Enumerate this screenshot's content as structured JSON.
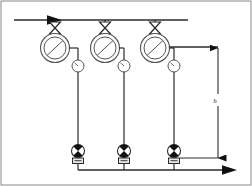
{
  "diagram": {
    "type": "piping-schematic",
    "canvas": {
      "width": 252,
      "height": 186
    },
    "colors": {
      "line": "#2b2b2b",
      "thin_line": "#555555",
      "fill_white": "#ffffff",
      "fill_black": "#111111",
      "background": "#ffffff"
    },
    "frame": {
      "stroke": "#8a8a8a",
      "x": 1,
      "y": 1,
      "width": 250,
      "height": 184
    },
    "supply_header": {
      "name": "supply-header-pipe",
      "y": 20,
      "x_start": 14,
      "x_end": 188,
      "inlet_arrow_x": 62,
      "inlet_arrow_label": "flow-in"
    },
    "return_header": {
      "name": "return-header-pipe",
      "y": 170,
      "x_start": 55,
      "x_end": 232,
      "outlet_arrow_x": 232,
      "outlet_arrow_label": "flow-out"
    },
    "branches": [
      {
        "id": "branch-1",
        "x": 55,
        "valve_y": 26,
        "filter_cy": 48,
        "filter_r_outer": 17,
        "filter_r_inner": 13,
        "gauge_cx": 78,
        "gauge_cy": 66,
        "gauge_r": 6,
        "pump_cy": 152,
        "pump_r": 7,
        "base_y": 162
      },
      {
        "id": "branch-2",
        "x": 105,
        "valve_y": 26,
        "filter_cy": 48,
        "filter_r_outer": 17,
        "filter_r_inner": 13,
        "gauge_cx": 124,
        "gauge_cy": 66,
        "gauge_r": 6,
        "pump_cy": 152,
        "pump_r": 7,
        "base_y": 162
      },
      {
        "id": "branch-3",
        "x": 155,
        "valve_y": 26,
        "filter_cy": 48,
        "filter_r_outer": 17,
        "filter_r_inner": 13,
        "gauge_cx": 174,
        "gauge_cy": 66,
        "gauge_r": 6,
        "pump_cy": 152,
        "pump_r": 7,
        "base_y": 162
      }
    ],
    "dimension": {
      "name": "height-dimension",
      "label": "h",
      "label_x": 216,
      "label_y": 101,
      "line_x": 218,
      "y_top": 52,
      "y_bottom": 158,
      "tie_line_from_x": 172,
      "tie_line_y": 52,
      "tie_line_bottom_from_x": 155,
      "tie_line_bottom_y": 158
    },
    "symbols": {
      "valve": "butterfly-valve-bowtie",
      "filter": "strainer-circle-diagonal",
      "gauge": "pressure-gauge",
      "pump": "pump-half-filled-circle",
      "arrow": "flow-direction-arrow"
    }
  }
}
